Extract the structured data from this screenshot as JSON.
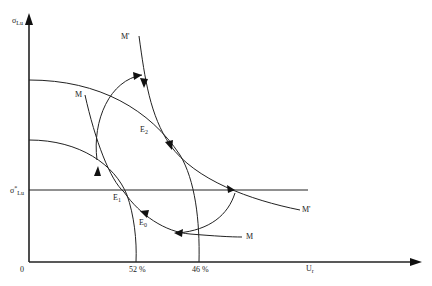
{
  "diagram": {
    "type": "phase-diagram",
    "axes": {
      "y_label": "σ",
      "y_label_sub": "Lu",
      "x_label": "U",
      "x_label_sub": "r",
      "origin": "0",
      "y_marker_label": "σ",
      "y_marker_sup": "*",
      "y_marker_sub": "Lu"
    },
    "x_ticks": [
      {
        "label": "52 %"
      },
      {
        "label": "46 %"
      }
    ],
    "curves": [
      {
        "name": "M",
        "label": "M"
      },
      {
        "name": "M-prime",
        "label": "M'"
      }
    ],
    "points": [
      {
        "name": "E1",
        "label": "E",
        "sub": "1"
      },
      {
        "name": "E2",
        "label": "E",
        "sub": "2"
      },
      {
        "name": "E0",
        "label": "E",
        "sub": "0"
      }
    ],
    "right_labels": {
      "m_lower": "M",
      "m_prime_right": "M'",
      "m_upper_left": "M",
      "m_prime_top": "M'"
    },
    "colors": {
      "line": "#222222",
      "background": "#ffffff"
    }
  }
}
